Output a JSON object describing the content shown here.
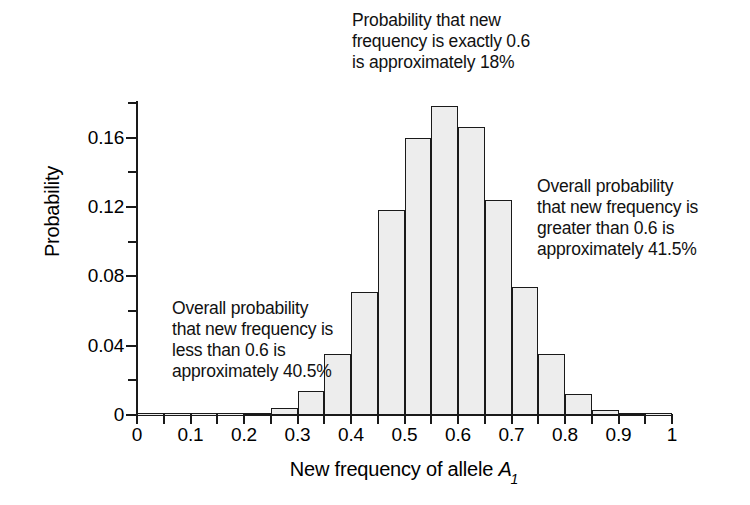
{
  "chart_data": {
    "type": "bar",
    "title": "",
    "xlabel": "New frequency of allele A1",
    "xlabel_parts": {
      "prefix": "New frequency of allele ",
      "symbol": "A",
      "subscript": "1"
    },
    "ylabel": "Probability",
    "xlim": [
      0,
      1
    ],
    "ylim": [
      0,
      0.18
    ],
    "grid": false,
    "legend": null,
    "bin_width": 0.05,
    "x_tick_labels": [
      "0",
      "0.1",
      "0.2",
      "0.3",
      "0.4",
      "0.5",
      "0.6",
      "0.7",
      "0.8",
      "0.9",
      "1"
    ],
    "x_tick_values": [
      0,
      0.1,
      0.2,
      0.3,
      0.4,
      0.5,
      0.6,
      0.7,
      0.8,
      0.9,
      1
    ],
    "x_minor_tick_values": [
      0,
      0.05,
      0.1,
      0.15,
      0.2,
      0.25,
      0.3,
      0.35,
      0.4,
      0.45,
      0.5,
      0.55,
      0.6,
      0.65,
      0.7,
      0.75,
      0.8,
      0.85,
      0.9,
      0.95,
      1
    ],
    "y_tick_labels": [
      "0",
      "0.04",
      "0.08",
      "0.12",
      "0.16"
    ],
    "y_tick_values": [
      0,
      0.04,
      0.08,
      0.12,
      0.16
    ],
    "y_minor_tick_values": [
      0.02,
      0.06,
      0.1,
      0.14,
      0.18
    ],
    "bin_starts": [
      0.0,
      0.05,
      0.1,
      0.15,
      0.2,
      0.25,
      0.3,
      0.35,
      0.4,
      0.45,
      0.5,
      0.55,
      0.6,
      0.65,
      0.7,
      0.75,
      0.8,
      0.85,
      0.9,
      0.95
    ],
    "bin_centers": [
      0.025,
      0.075,
      0.125,
      0.175,
      0.225,
      0.275,
      0.325,
      0.375,
      0.425,
      0.475,
      0.525,
      0.575,
      0.625,
      0.675,
      0.725,
      0.775,
      0.825,
      0.875,
      0.925,
      0.975
    ],
    "values": [
      0,
      0,
      0,
      0,
      0.001,
      0.004,
      0.014,
      0.035,
      0.071,
      0.118,
      0.16,
      0.178,
      0.166,
      0.124,
      0.074,
      0.035,
      0.012,
      0.003,
      0.001,
      0
    ],
    "bar_fill_color": "#ededed",
    "bar_edge_color": "#1a1a1a",
    "annotations": [
      {
        "id": "peak",
        "text": "Probability that new\nfrequency is exactly 0.6\nis approximately 18%",
        "refers_to_value": 0.18
      },
      {
        "id": "left",
        "text": "Overall probability\nthat new frequency is\nless than 0.6 is\napproximately 40.5%",
        "refers_to_value": 0.405
      },
      {
        "id": "right",
        "text": "Overall probability\nthat new frequency is\ngreater than 0.6 is\napproximately 41.5%",
        "refers_to_value": 0.415
      }
    ]
  }
}
